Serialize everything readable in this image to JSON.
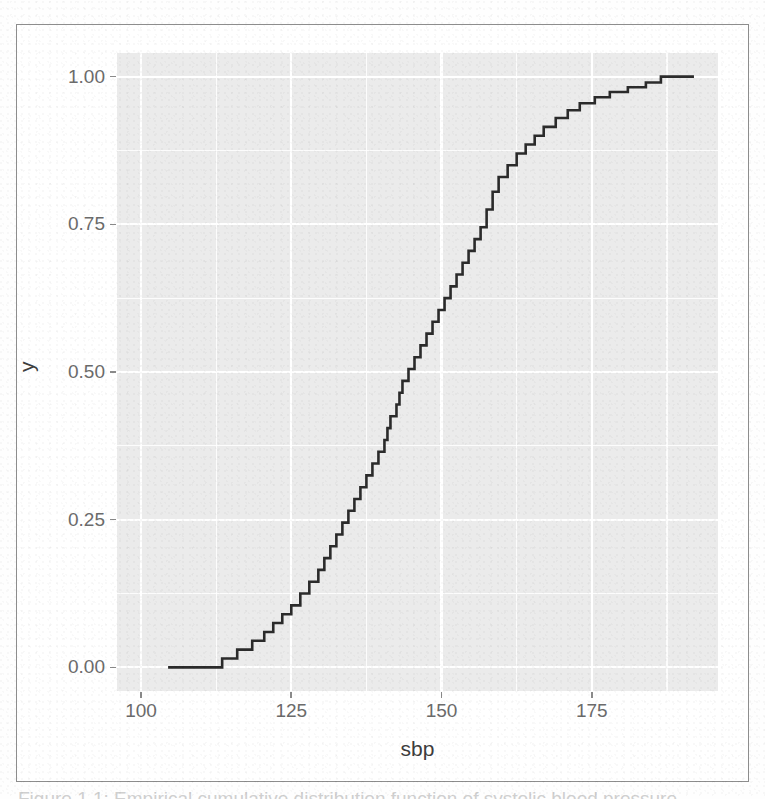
{
  "figure": {
    "caption_sliver": "Figure 1.1: Empirical cumulative distribution function of systolic blood pressure"
  },
  "axis_titles": {
    "x": "sbp",
    "y": "y"
  },
  "colors": {
    "panel_background": "#ebebeb",
    "gridline": "#ffffff",
    "line": "#2b2b2b",
    "tick_label": "#6b6b6b",
    "axis_title": "#3d3d3d",
    "figure_border": "#8d8d8d"
  },
  "chart_data": {
    "type": "line",
    "title": "",
    "xlabel": "sbp",
    "ylabel": "y",
    "xlim": [
      96,
      196
    ],
    "ylim": [
      -0.04,
      1.04
    ],
    "grid": true,
    "legend": "none",
    "x_ticks": [
      100,
      125,
      150,
      175
    ],
    "x_minor_ticks": [
      112.5,
      137.5,
      162.5,
      187.5
    ],
    "y_ticks": [
      0.0,
      0.25,
      0.5,
      0.75,
      1.0
    ],
    "y_tick_labels": [
      "0.00",
      "0.25",
      "0.50",
      "0.75",
      "1.00"
    ],
    "y_minor_ticks": [
      0.125,
      0.375,
      0.625,
      0.875
    ],
    "step_direction": "hv",
    "series": [
      {
        "name": "ecdf",
        "x": [
          104.5,
          111.5,
          113.5,
          116.0,
          118.5,
          120.5,
          122.0,
          123.5,
          125.0,
          126.5,
          128.0,
          129.5,
          130.5,
          131.5,
          132.5,
          133.5,
          134.5,
          135.5,
          136.5,
          137.5,
          138.5,
          139.5,
          140.5,
          141.0,
          141.5,
          142.5,
          143.0,
          143.5,
          144.5,
          145.5,
          146.5,
          147.5,
          148.5,
          149.5,
          150.5,
          151.5,
          152.5,
          153.5,
          154.5,
          155.5,
          156.5,
          157.5,
          158.5,
          159.5,
          161.0,
          162.5,
          164.0,
          165.5,
          167.0,
          169.0,
          171.0,
          173.0,
          175.5,
          178.0,
          181.0,
          184.0,
          186.5,
          192.0
        ],
        "y": [
          0.0,
          0.0,
          0.015,
          0.03,
          0.045,
          0.06,
          0.075,
          0.09,
          0.105,
          0.125,
          0.145,
          0.165,
          0.185,
          0.205,
          0.225,
          0.245,
          0.265,
          0.285,
          0.305,
          0.325,
          0.345,
          0.365,
          0.385,
          0.405,
          0.425,
          0.445,
          0.465,
          0.485,
          0.505,
          0.525,
          0.545,
          0.565,
          0.585,
          0.605,
          0.625,
          0.645,
          0.665,
          0.685,
          0.705,
          0.725,
          0.745,
          0.775,
          0.805,
          0.83,
          0.85,
          0.87,
          0.885,
          0.9,
          0.915,
          0.93,
          0.943,
          0.955,
          0.965,
          0.974,
          0.982,
          0.99,
          1.0,
          1.0
        ]
      }
    ]
  }
}
